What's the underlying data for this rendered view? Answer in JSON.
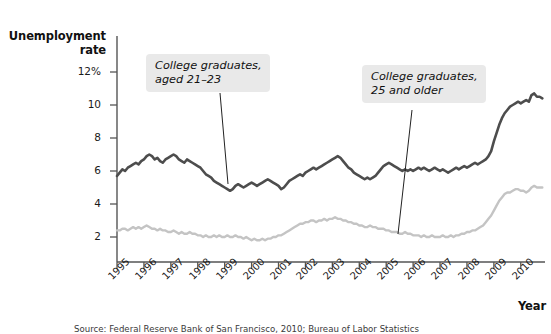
{
  "chart_data": {
    "type": "line",
    "title": "",
    "xlabel": "Year",
    "ylabel": "Unemployment rate",
    "xlim": [
      1995,
      2010.9
    ],
    "ylim": [
      0,
      12.8
    ],
    "grid": false,
    "legend_position": "inline-annotations",
    "y_ticks": [
      "12%",
      "10",
      "8",
      "6",
      "4",
      "2"
    ],
    "y_tick_values": [
      12,
      10,
      8,
      6,
      4,
      2
    ],
    "x_ticks": [
      "1995",
      "1996",
      "1997",
      "1998",
      "1999",
      "2000",
      "2001",
      "2002",
      "2003",
      "2004",
      "2005",
      "2006",
      "2007",
      "2008",
      "2009",
      "2010"
    ],
    "x_tick_values": [
      1995,
      1996,
      1997,
      1998,
      1999,
      2000,
      2001,
      2002,
      2003,
      2004,
      2005,
      2006,
      2007,
      2008,
      2009,
      2010
    ],
    "annotations": [
      {
        "id": "young",
        "text": "College graduates,\naged 21–23",
        "points_to": {
          "x": 1999.4,
          "y": 5.6
        }
      },
      {
        "id": "older",
        "text": "College graduates,\n25 and older",
        "points_to": {
          "x": 2005.8,
          "y": 2.1
        }
      }
    ],
    "series": [
      {
        "name": "College graduates, aged 21–23",
        "color": "#4d4d4d",
        "x": [
          1995.0,
          1995.1,
          1995.2,
          1995.3,
          1995.4,
          1995.5,
          1995.6,
          1995.7,
          1995.8,
          1995.9,
          1996.0,
          1996.1,
          1996.2,
          1996.3,
          1996.4,
          1996.5,
          1996.6,
          1996.7,
          1996.8,
          1996.9,
          1997.0,
          1997.1,
          1997.2,
          1997.3,
          1997.4,
          1997.5,
          1997.6,
          1997.7,
          1997.8,
          1997.9,
          1998.0,
          1998.1,
          1998.2,
          1998.3,
          1998.4,
          1998.5,
          1998.6,
          1998.7,
          1998.8,
          1998.9,
          1999.0,
          1999.1,
          1999.2,
          1999.3,
          1999.4,
          1999.5,
          1999.6,
          1999.7,
          1999.8,
          1999.9,
          2000.0,
          2000.1,
          2000.2,
          2000.3,
          2000.4,
          2000.5,
          2000.6,
          2000.7,
          2000.8,
          2000.9,
          2001.0,
          2001.1,
          2001.2,
          2001.3,
          2001.4,
          2001.5,
          2001.6,
          2001.7,
          2001.8,
          2001.9,
          2002.0,
          2002.1,
          2002.2,
          2002.3,
          2002.4,
          2002.5,
          2002.6,
          2002.7,
          2002.8,
          2002.9,
          2003.0,
          2003.1,
          2003.2,
          2003.3,
          2003.4,
          2003.5,
          2003.6,
          2003.7,
          2003.8,
          2003.9,
          2004.0,
          2004.1,
          2004.2,
          2004.3,
          2004.4,
          2004.5,
          2004.6,
          2004.7,
          2004.8,
          2004.9,
          2005.0,
          2005.1,
          2005.2,
          2005.3,
          2005.4,
          2005.5,
          2005.6,
          2005.7,
          2005.8,
          2005.9,
          2006.0,
          2006.1,
          2006.2,
          2006.3,
          2006.4,
          2006.5,
          2006.6,
          2006.7,
          2006.8,
          2006.9,
          2007.0,
          2007.1,
          2007.2,
          2007.3,
          2007.4,
          2007.5,
          2007.6,
          2007.7,
          2007.8,
          2007.9,
          2008.0,
          2008.1,
          2008.2,
          2008.3,
          2008.4,
          2008.5,
          2008.6,
          2008.7,
          2008.8,
          2008.9,
          2009.0,
          2009.1,
          2009.2,
          2009.3,
          2009.4,
          2009.5,
          2009.6,
          2009.7,
          2009.8,
          2009.9,
          2010.0,
          2010.1,
          2010.2,
          2010.3,
          2010.4,
          2010.5,
          2010.6,
          2010.7,
          2010.8
        ],
        "y": [
          5.7,
          5.9,
          6.1,
          6.0,
          6.2,
          6.3,
          6.4,
          6.5,
          6.4,
          6.6,
          6.7,
          6.9,
          7.0,
          6.9,
          6.7,
          6.8,
          6.6,
          6.5,
          6.7,
          6.8,
          6.9,
          7.0,
          6.9,
          6.7,
          6.6,
          6.5,
          6.7,
          6.6,
          6.5,
          6.4,
          6.3,
          6.2,
          6.0,
          5.8,
          5.7,
          5.6,
          5.4,
          5.3,
          5.2,
          5.1,
          5.0,
          4.9,
          4.8,
          4.9,
          5.1,
          5.2,
          5.1,
          5.0,
          5.1,
          5.2,
          5.3,
          5.2,
          5.1,
          5.2,
          5.3,
          5.4,
          5.5,
          5.4,
          5.3,
          5.2,
          5.1,
          4.9,
          5.0,
          5.2,
          5.4,
          5.5,
          5.6,
          5.7,
          5.8,
          5.7,
          5.9,
          6.0,
          6.1,
          6.2,
          6.1,
          6.2,
          6.3,
          6.4,
          6.5,
          6.6,
          6.7,
          6.8,
          6.9,
          6.8,
          6.6,
          6.4,
          6.2,
          6.1,
          5.9,
          5.8,
          5.7,
          5.6,
          5.5,
          5.6,
          5.5,
          5.6,
          5.7,
          5.9,
          6.1,
          6.3,
          6.4,
          6.5,
          6.4,
          6.3,
          6.2,
          6.1,
          6.0,
          6.1,
          6.0,
          6.1,
          6.0,
          6.1,
          6.2,
          6.1,
          6.2,
          6.1,
          6.0,
          6.1,
          6.2,
          6.1,
          6.0,
          6.1,
          6.0,
          5.9,
          6.0,
          6.1,
          6.2,
          6.1,
          6.2,
          6.3,
          6.2,
          6.3,
          6.4,
          6.5,
          6.4,
          6.5,
          6.6,
          6.7,
          6.9,
          7.2,
          7.8,
          8.3,
          8.8,
          9.2,
          9.5,
          9.7,
          9.9,
          10.0,
          10.1,
          10.2,
          10.1,
          10.2,
          10.3,
          10.2,
          10.6,
          10.7,
          10.5,
          10.5,
          10.4
        ]
      },
      {
        "name": "College graduates, 25 and older",
        "color": "#c4c4c4",
        "x": [
          1995.0,
          1995.1,
          1995.2,
          1995.3,
          1995.4,
          1995.5,
          1995.6,
          1995.7,
          1995.8,
          1995.9,
          1996.0,
          1996.1,
          1996.2,
          1996.3,
          1996.4,
          1996.5,
          1996.6,
          1996.7,
          1996.8,
          1996.9,
          1997.0,
          1997.1,
          1997.2,
          1997.3,
          1997.4,
          1997.5,
          1997.6,
          1997.7,
          1997.8,
          1997.9,
          1998.0,
          1998.1,
          1998.2,
          1998.3,
          1998.4,
          1998.5,
          1998.6,
          1998.7,
          1998.8,
          1998.9,
          1999.0,
          1999.1,
          1999.2,
          1999.3,
          1999.4,
          1999.5,
          1999.6,
          1999.7,
          1999.8,
          1999.9,
          2000.0,
          2000.1,
          2000.2,
          2000.3,
          2000.4,
          2000.5,
          2000.6,
          2000.7,
          2000.8,
          2000.9,
          2001.0,
          2001.1,
          2001.2,
          2001.3,
          2001.4,
          2001.5,
          2001.6,
          2001.7,
          2001.8,
          2001.9,
          2002.0,
          2002.1,
          2002.2,
          2002.3,
          2002.4,
          2002.5,
          2002.6,
          2002.7,
          2002.8,
          2002.9,
          2003.0,
          2003.1,
          2003.2,
          2003.3,
          2003.4,
          2003.5,
          2003.6,
          2003.7,
          2003.8,
          2003.9,
          2004.0,
          2004.1,
          2004.2,
          2004.3,
          2004.4,
          2004.5,
          2004.6,
          2004.7,
          2004.8,
          2004.9,
          2005.0,
          2005.1,
          2005.2,
          2005.3,
          2005.4,
          2005.5,
          2005.6,
          2005.7,
          2005.8,
          2005.9,
          2006.0,
          2006.1,
          2006.2,
          2006.3,
          2006.4,
          2006.5,
          2006.6,
          2006.7,
          2006.8,
          2006.9,
          2007.0,
          2007.1,
          2007.2,
          2007.3,
          2007.4,
          2007.5,
          2007.6,
          2007.7,
          2007.8,
          2007.9,
          2008.0,
          2008.1,
          2008.2,
          2008.3,
          2008.4,
          2008.5,
          2008.6,
          2008.7,
          2008.8,
          2008.9,
          2009.0,
          2009.1,
          2009.2,
          2009.3,
          2009.4,
          2009.5,
          2009.6,
          2009.7,
          2009.8,
          2009.9,
          2010.0,
          2010.1,
          2010.2,
          2010.3,
          2010.4,
          2010.5,
          2010.6,
          2010.7,
          2010.8
        ],
        "y": [
          2.4,
          2.4,
          2.5,
          2.5,
          2.4,
          2.5,
          2.6,
          2.5,
          2.6,
          2.5,
          2.6,
          2.7,
          2.6,
          2.5,
          2.5,
          2.4,
          2.5,
          2.4,
          2.4,
          2.3,
          2.3,
          2.4,
          2.3,
          2.2,
          2.3,
          2.2,
          2.2,
          2.3,
          2.2,
          2.2,
          2.1,
          2.1,
          2.0,
          2.1,
          2.0,
          2.0,
          2.1,
          2.0,
          2.1,
          2.0,
          2.0,
          2.1,
          2.0,
          2.0,
          2.1,
          2.0,
          2.0,
          1.9,
          2.0,
          1.9,
          1.8,
          1.9,
          1.8,
          1.8,
          1.9,
          1.8,
          1.9,
          1.9,
          2.0,
          2.0,
          2.1,
          2.1,
          2.2,
          2.3,
          2.4,
          2.5,
          2.6,
          2.7,
          2.8,
          2.8,
          2.9,
          2.9,
          3.0,
          3.0,
          2.9,
          3.0,
          3.0,
          3.1,
          3.0,
          3.1,
          3.1,
          3.2,
          3.1,
          3.1,
          3.0,
          3.0,
          2.9,
          2.9,
          2.8,
          2.8,
          2.7,
          2.7,
          2.6,
          2.6,
          2.7,
          2.6,
          2.6,
          2.5,
          2.5,
          2.5,
          2.4,
          2.4,
          2.3,
          2.3,
          2.3,
          2.2,
          2.2,
          2.3,
          2.2,
          2.2,
          2.1,
          2.1,
          2.1,
          2.0,
          2.1,
          2.0,
          2.0,
          2.1,
          2.0,
          2.0,
          2.0,
          2.1,
          2.0,
          2.0,
          2.1,
          2.0,
          2.1,
          2.1,
          2.2,
          2.2,
          2.3,
          2.3,
          2.4,
          2.4,
          2.5,
          2.6,
          2.7,
          2.9,
          3.1,
          3.3,
          3.6,
          3.9,
          4.2,
          4.4,
          4.6,
          4.7,
          4.7,
          4.8,
          4.9,
          4.9,
          4.8,
          4.8,
          4.7,
          4.8,
          5.0,
          5.1,
          5.0,
          5.0,
          5.0
        ]
      }
    ]
  },
  "axes": {
    "y_title": "Unemployment\nrate",
    "x_title": "Year"
  },
  "source": {
    "text": "Source: Federal Reserve Bank of San Francisco, 2010; Bureau of Labor Statistics"
  },
  "colors": {
    "series_young": "#4d4d4d",
    "series_older": "#c4c4c4",
    "axis": "#555555",
    "callout_bg": "#e9e9e9",
    "text": "#111111"
  }
}
